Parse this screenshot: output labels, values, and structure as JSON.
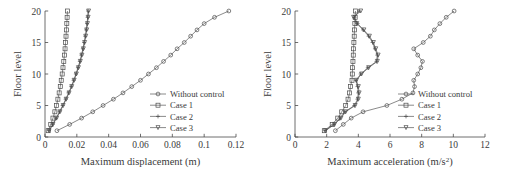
{
  "figure": {
    "background": "#ffffff",
    "line_color": "#4a4a4a",
    "panel_count": 2
  },
  "chart_data": [
    {
      "type": "line",
      "id": "maximum-displacement",
      "title": "",
      "xlabel": "Maximum displacement (m)",
      "ylabel": "Floor level",
      "xlim": [
        0,
        0.12
      ],
      "ylim": [
        0,
        20
      ],
      "xticks": [
        0,
        0.02,
        0.04,
        0.06,
        0.08,
        0.1,
        0.12
      ],
      "xtick_labels": [
        "0",
        "0.02",
        "0.04",
        "0.06",
        "0.08",
        "0.1",
        "0.12"
      ],
      "yticks": [
        0,
        5,
        10,
        15,
        20
      ],
      "ytick_labels": [
        "0",
        "5",
        "10",
        "15",
        "20"
      ],
      "grid": false,
      "legend_position": "center-right",
      "orientation": "y-is-floor-level",
      "y": [
        1,
        2,
        3,
        4,
        5,
        6,
        7,
        8,
        9,
        10,
        11,
        12,
        13,
        14,
        15,
        16,
        17,
        18,
        19,
        20
      ],
      "series": [
        {
          "name": "Without control",
          "marker": "circle",
          "values": [
            0.0075,
            0.0155,
            0.023,
            0.03,
            0.0365,
            0.043,
            0.049,
            0.0545,
            0.06,
            0.065,
            0.07,
            0.0745,
            0.079,
            0.083,
            0.0875,
            0.0915,
            0.0955,
            0.1,
            0.1065,
            0.1155
          ]
        },
        {
          "name": "Case 1",
          "marker": "square",
          "values": [
            0.002,
            0.0036,
            0.005,
            0.0062,
            0.0072,
            0.0081,
            0.0089,
            0.0096,
            0.0102,
            0.0108,
            0.0113,
            0.0118,
            0.0122,
            0.0126,
            0.0129,
            0.0132,
            0.0135,
            0.0137,
            0.0139,
            0.0141
          ]
        },
        {
          "name": "Case 2",
          "marker": "plus",
          "values": [
            0.0025,
            0.0048,
            0.007,
            0.0091,
            0.0111,
            0.013,
            0.0148,
            0.0165,
            0.018,
            0.0194,
            0.0207,
            0.0219,
            0.0229,
            0.0238,
            0.0246,
            0.0253,
            0.0259,
            0.0264,
            0.0268,
            0.0271
          ]
        },
        {
          "name": "Case 3",
          "marker": "triangle-down",
          "values": [
            0.0026,
            0.005,
            0.0073,
            0.0094,
            0.0114,
            0.0133,
            0.0151,
            0.0168,
            0.0183,
            0.0197,
            0.021,
            0.0222,
            0.0232,
            0.0241,
            0.0249,
            0.0256,
            0.0262,
            0.0267,
            0.0271,
            0.0274
          ]
        }
      ]
    },
    {
      "type": "line",
      "id": "maximum-acceleration",
      "title": "",
      "xlabel": "Maximum acceleration (m/s2)",
      "xlabel_base": "Maximum acceleration (m/s",
      "xlabel_sup": "2",
      "xlabel_tail": ")",
      "ylabel": "Floor level",
      "xlim": [
        0,
        12
      ],
      "ylim": [
        0,
        20
      ],
      "xticks": [
        0,
        2,
        4,
        6,
        8,
        10,
        12
      ],
      "xtick_labels": [
        "0",
        "2",
        "4",
        "6",
        "8",
        "10",
        "12"
      ],
      "yticks": [
        0,
        5,
        10,
        15,
        20
      ],
      "ytick_labels": [
        "0",
        "5",
        "10",
        "15",
        "20"
      ],
      "grid": false,
      "legend_position": "center-right",
      "orientation": "y-is-floor-level",
      "y": [
        1,
        2,
        3,
        4,
        5,
        6,
        7,
        8,
        9,
        10,
        11,
        12,
        13,
        14,
        15,
        16,
        17,
        18,
        19,
        20
      ],
      "series": [
        {
          "name": "Without control",
          "marker": "circle",
          "values": [
            2.55,
            3.05,
            3.55,
            4.3,
            5.8,
            6.75,
            7.45,
            7.55,
            7.5,
            7.75,
            7.95,
            8.05,
            7.75,
            7.5,
            8.1,
            8.55,
            8.8,
            9.15,
            9.55,
            10.05
          ]
        },
        {
          "name": "Case 1",
          "marker": "square",
          "values": [
            1.85,
            2.35,
            2.7,
            2.95,
            3.2,
            3.35,
            3.45,
            3.5,
            3.6,
            3.62,
            3.64,
            3.66,
            3.68,
            3.7,
            3.72,
            3.74,
            3.76,
            3.78,
            3.8,
            3.82
          ]
        },
        {
          "name": "Case 2",
          "marker": "plus",
          "values": [
            1.9,
            2.45,
            2.85,
            3.15,
            3.75,
            3.95,
            4.0,
            3.95,
            3.85,
            4.15,
            4.6,
            5.15,
            5.2,
            5.05,
            4.9,
            4.65,
            4.3,
            3.95,
            3.75,
            4.05
          ]
        },
        {
          "name": "Case 3",
          "marker": "triangle-down",
          "values": [
            1.92,
            2.5,
            2.9,
            3.2,
            3.8,
            4.0,
            4.05,
            4.0,
            3.88,
            4.2,
            4.65,
            5.2,
            5.25,
            5.1,
            4.95,
            4.7,
            4.35,
            3.9,
            3.7,
            4.15
          ]
        }
      ]
    }
  ],
  "legend": {
    "items": [
      {
        "label": "Without control",
        "marker": "circle"
      },
      {
        "label": "Case 1",
        "marker": "square"
      },
      {
        "label": "Case 2",
        "marker": "plus"
      },
      {
        "label": "Case 3",
        "marker": "triangle-down"
      }
    ]
  }
}
